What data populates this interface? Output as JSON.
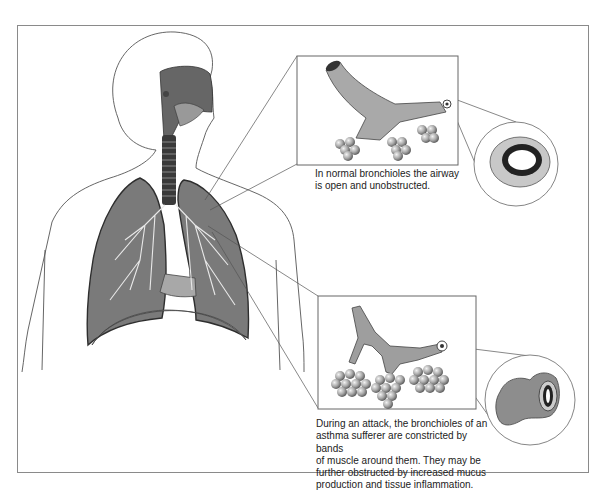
{
  "figure": {
    "panels": [
      {
        "id": "normal",
        "caption_lines": [
          "In normal bronchioles the airway",
          "is open and unobstructed."
        ],
        "cross_section": "open airway"
      },
      {
        "id": "attack",
        "caption_lines": [
          "During an attack, the bronchioles of an",
          "asthma sufferer are constricted by bands",
          "of muscle around them. They may be",
          "further obstructed by increased mucus",
          "production and tissue inflammation."
        ],
        "cross_section": "constricted airway"
      }
    ],
    "main_illustration": "human torso with respiratory tract and lungs",
    "colors": {
      "frame": "#8a8a8a",
      "tissue_dark": "#555555",
      "tissue_mid": "#8c8c8c",
      "tissue_light": "#b5b5b5",
      "outline": "#333333",
      "background": "#ffffff"
    }
  }
}
